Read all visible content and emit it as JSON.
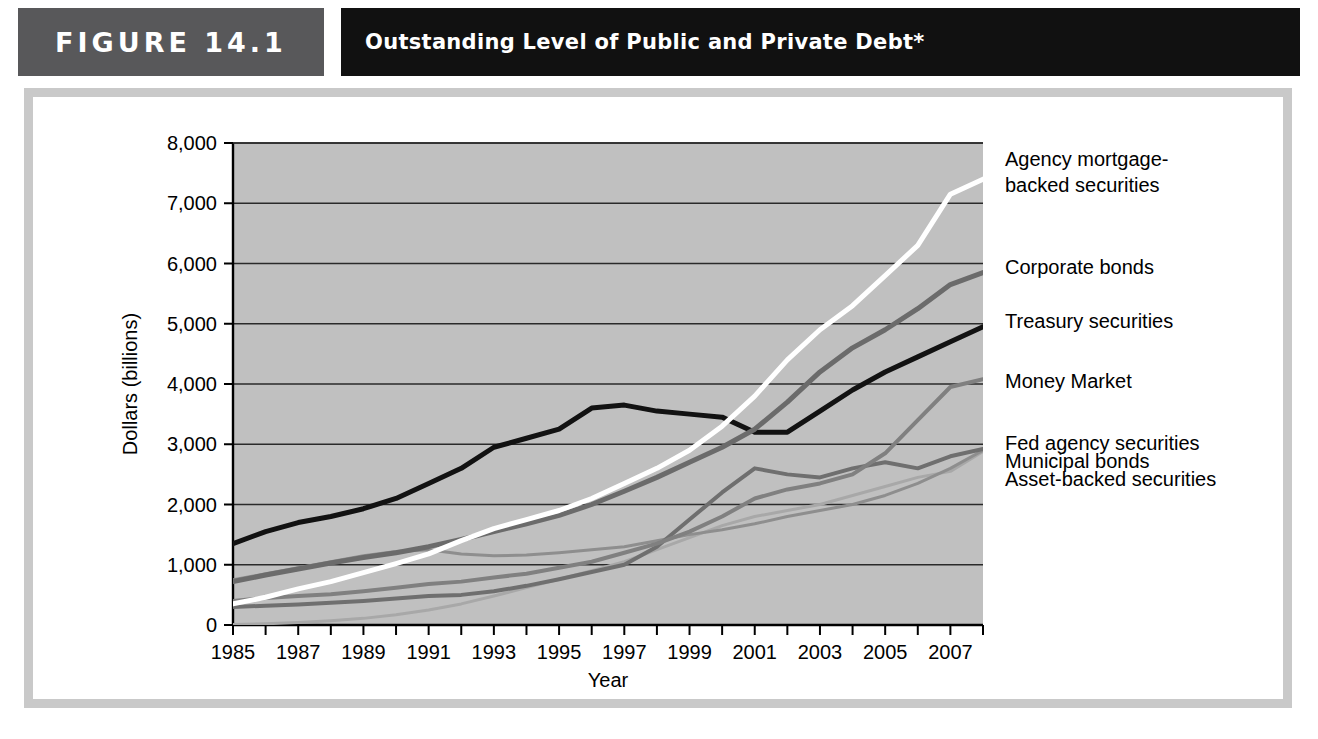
{
  "figure": {
    "tag": "FIGURE  14.1",
    "title": "Outstanding Level of Public and Private Debt*"
  },
  "chart_data": {
    "type": "line",
    "title": "Outstanding Level of Public and Private Debt*",
    "xlabel": "Year",
    "ylabel": "Dollars (billions)",
    "xlim": [
      1985,
      2008
    ],
    "ylim": [
      0,
      8000
    ],
    "ytick_values": [
      0,
      1000,
      2000,
      3000,
      4000,
      5000,
      6000,
      7000,
      8000
    ],
    "ytick_labels": [
      "0",
      "1,000",
      "2,000",
      "3,000",
      "4,000",
      "5,000",
      "6,000",
      "7,000",
      "8,000"
    ],
    "xtick_values": [
      1985,
      1986,
      1987,
      1988,
      1989,
      1990,
      1991,
      1992,
      1993,
      1994,
      1995,
      1996,
      1997,
      1998,
      1999,
      2000,
      2001,
      2002,
      2003,
      2004,
      2005,
      2006,
      2007,
      2008
    ],
    "xtick_labels_shown": [
      "1985",
      "1987",
      "1989",
      "1991",
      "1993",
      "1995",
      "1997",
      "1999",
      "2001",
      "2003",
      "2005",
      "2007"
    ],
    "grid": "horizontal",
    "legend_position": "right-inline",
    "plot_background": "#c0c0c0",
    "x": [
      1985,
      1986,
      1987,
      1988,
      1989,
      1990,
      1991,
      1992,
      1993,
      1994,
      1995,
      1996,
      1997,
      1998,
      1999,
      2000,
      2001,
      2002,
      2003,
      2004,
      2005,
      2006,
      2007,
      2008
    ],
    "series": [
      {
        "name": "Agency mortgage-backed securities",
        "color": "#ffffff",
        "width": 5,
        "label_y": 7450,
        "values": [
          350,
          460,
          600,
          720,
          870,
          1020,
          1180,
          1400,
          1600,
          1750,
          1900,
          2100,
          2350,
          2600,
          2900,
          3300,
          3800,
          4400,
          4900,
          5300,
          5800,
          6300,
          7150,
          7400
        ]
      },
      {
        "name": "Corporate bonds",
        "color": "#6b6b6b",
        "width": 5,
        "label_y": 5950,
        "values": [
          720,
          830,
          930,
          1030,
          1120,
          1200,
          1300,
          1420,
          1550,
          1680,
          1820,
          2000,
          2220,
          2450,
          2700,
          2950,
          3250,
          3700,
          4200,
          4600,
          4900,
          5250,
          5650,
          5850
        ]
      },
      {
        "name": "Treasury securities",
        "color": "#121212",
        "width": 5,
        "label_y": 5050,
        "values": [
          1350,
          1550,
          1700,
          1800,
          1930,
          2100,
          2350,
          2600,
          2950,
          3100,
          3250,
          3600,
          3650,
          3550,
          3500,
          3450,
          3200,
          3200,
          3550,
          3900,
          4200,
          4450,
          4700,
          4950
        ]
      },
      {
        "name": "Money Market",
        "color": "#808080",
        "width": 4,
        "label_y": 4050,
        "values": [
          400,
          450,
          480,
          510,
          560,
          620,
          680,
          720,
          790,
          850,
          950,
          1050,
          1200,
          1350,
          1550,
          1800,
          2100,
          2250,
          2350,
          2500,
          2850,
          3400,
          3950,
          4080
        ]
      },
      {
        "name": "Fed agency securities",
        "color": "#6f6f6f",
        "width": 4,
        "label_y": 3020,
        "values": [
          300,
          320,
          340,
          370,
          400,
          440,
          480,
          500,
          560,
          650,
          760,
          880,
          1000,
          1300,
          1750,
          2200,
          2600,
          2500,
          2450,
          2600,
          2700,
          2600,
          2800,
          2920
        ]
      },
      {
        "name": "Municipal bonds",
        "color": "#8e8e8e",
        "width": 3,
        "label_y": 2720,
        "values": [
          750,
          850,
          950,
          1050,
          1150,
          1220,
          1250,
          1180,
          1150,
          1160,
          1200,
          1250,
          1300,
          1400,
          1500,
          1580,
          1680,
          1800,
          1900,
          2000,
          2150,
          2350,
          2600,
          2900
        ]
      },
      {
        "name": "Asset-backed securities",
        "color": "#a8a8a8",
        "width": 3,
        "label_y": 2420,
        "values": [
          10,
          20,
          40,
          70,
          110,
          170,
          250,
          350,
          480,
          620,
          760,
          900,
          1050,
          1250,
          1450,
          1650,
          1800,
          1900,
          2000,
          2150,
          2300,
          2450,
          2550,
          2880
        ]
      }
    ]
  }
}
